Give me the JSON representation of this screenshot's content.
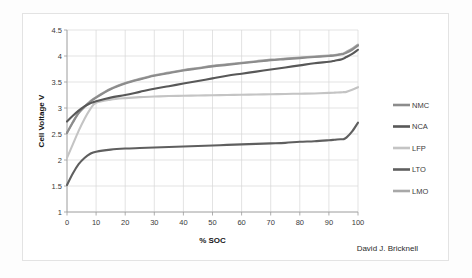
{
  "figure": {
    "credit": "David J. Bricknell",
    "background_color": "#ffffff",
    "frame_color": "#e3e3e3"
  },
  "chart_data": {
    "type": "line",
    "title": "",
    "xlabel": "% SOC",
    "ylabel": "Cell Voltage V",
    "xlim": [
      0,
      100
    ],
    "ylim": [
      1,
      4.5
    ],
    "xticks": [
      0,
      10,
      20,
      30,
      40,
      50,
      60,
      70,
      80,
      90,
      100
    ],
    "xtick_labels": [
      "0",
      "10",
      "20",
      "30",
      "40",
      "50",
      "60",
      "70",
      "80",
      "90",
      "100"
    ],
    "yticks": [
      1,
      1.5,
      2,
      2.5,
      3,
      3.5,
      4,
      4.5
    ],
    "ytick_labels": [
      "1",
      "1.5",
      "2",
      "2.5",
      "3",
      "3.5",
      "4",
      "4.5"
    ],
    "grid": true,
    "legend_position": "right",
    "x": [
      0,
      2,
      4,
      6,
      8,
      10,
      15,
      20,
      25,
      30,
      35,
      40,
      45,
      50,
      55,
      60,
      65,
      70,
      75,
      80,
      85,
      90,
      92,
      94,
      95,
      96,
      98,
      100
    ],
    "series": [
      {
        "name": "NMC",
        "color": "#8c8c8c",
        "values": [
          2.52,
          2.72,
          2.9,
          3.02,
          3.12,
          3.2,
          3.36,
          3.47,
          3.55,
          3.62,
          3.67,
          3.72,
          3.76,
          3.8,
          3.83,
          3.86,
          3.89,
          3.92,
          3.94,
          3.96,
          3.98,
          4.0,
          4.01,
          4.03,
          4.04,
          4.06,
          4.12,
          4.2
        ]
      },
      {
        "name": "NCA",
        "color": "#585858",
        "values": [
          2.74,
          2.85,
          2.95,
          3.03,
          3.09,
          3.13,
          3.2,
          3.25,
          3.31,
          3.37,
          3.42,
          3.47,
          3.52,
          3.57,
          3.62,
          3.66,
          3.7,
          3.74,
          3.78,
          3.82,
          3.86,
          3.89,
          3.91,
          3.93,
          3.95,
          3.98,
          4.04,
          4.12
        ]
      },
      {
        "name": "LFP",
        "color": "#c4c4c4",
        "values": [
          2.04,
          2.3,
          2.56,
          2.79,
          2.98,
          3.1,
          3.16,
          3.19,
          3.21,
          3.22,
          3.23,
          3.235,
          3.24,
          3.245,
          3.25,
          3.255,
          3.26,
          3.265,
          3.27,
          3.275,
          3.28,
          3.29,
          3.295,
          3.3,
          3.305,
          3.31,
          3.35,
          3.4
        ]
      },
      {
        "name": "LTO",
        "color": "#5f5f5f",
        "values": [
          1.52,
          1.74,
          1.92,
          2.04,
          2.12,
          2.16,
          2.2,
          2.22,
          2.23,
          2.24,
          2.25,
          2.26,
          2.27,
          2.28,
          2.29,
          2.3,
          2.31,
          2.32,
          2.33,
          2.35,
          2.36,
          2.38,
          2.39,
          2.4,
          2.4,
          2.43,
          2.55,
          2.72
        ]
      },
      {
        "name": "LMO",
        "color": "#a8a8a8",
        "values": [
          2.52,
          2.73,
          2.91,
          3.03,
          3.13,
          3.21,
          3.37,
          3.48,
          3.56,
          3.63,
          3.68,
          3.73,
          3.77,
          3.81,
          3.84,
          3.87,
          3.9,
          3.93,
          3.95,
          3.97,
          3.99,
          4.01,
          4.02,
          4.04,
          4.05,
          4.08,
          4.14,
          4.22
        ]
      }
    ],
    "legend": [
      {
        "label": "NMC",
        "color": "#8c8c8c"
      },
      {
        "label": "NCA",
        "color": "#585858"
      },
      {
        "label": "LFP",
        "color": "#c4c4c4"
      },
      {
        "label": "LTO",
        "color": "#5f5f5f"
      },
      {
        "label": "LMO",
        "color": "#a8a8a8"
      }
    ]
  }
}
